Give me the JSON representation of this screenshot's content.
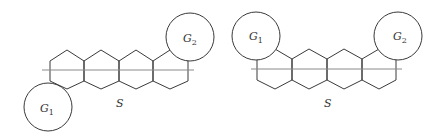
{
  "figures": [
    {
      "name": "left-figure",
      "graph_label": "S",
      "circles": [
        {
          "label": "G",
          "sub": "1"
        },
        {
          "label": "G",
          "sub": "2"
        }
      ]
    },
    {
      "name": "right-figure",
      "graph_label": "S",
      "circles": [
        {
          "label": "G",
          "sub": "1"
        },
        {
          "label": "G",
          "sub": "2"
        }
      ]
    }
  ],
  "colors": {
    "stroke": "#3a3a3a",
    "axis": "#8a8a8a",
    "background": "#ffffff"
  }
}
